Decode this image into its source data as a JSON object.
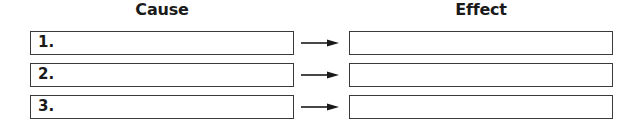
{
  "headings": {
    "cause": "Cause",
    "effect": "Effect"
  },
  "rows": [
    {
      "number": "1.",
      "cause": "",
      "effect": ""
    },
    {
      "number": "2.",
      "cause": "",
      "effect": ""
    },
    {
      "number": "3.",
      "cause": "",
      "effect": ""
    }
  ],
  "icons": {
    "connector": "right-arrow-icon"
  },
  "colors": {
    "border": "#3a3a3a",
    "text": "#1a1a1a",
    "background": "#ffffff"
  }
}
